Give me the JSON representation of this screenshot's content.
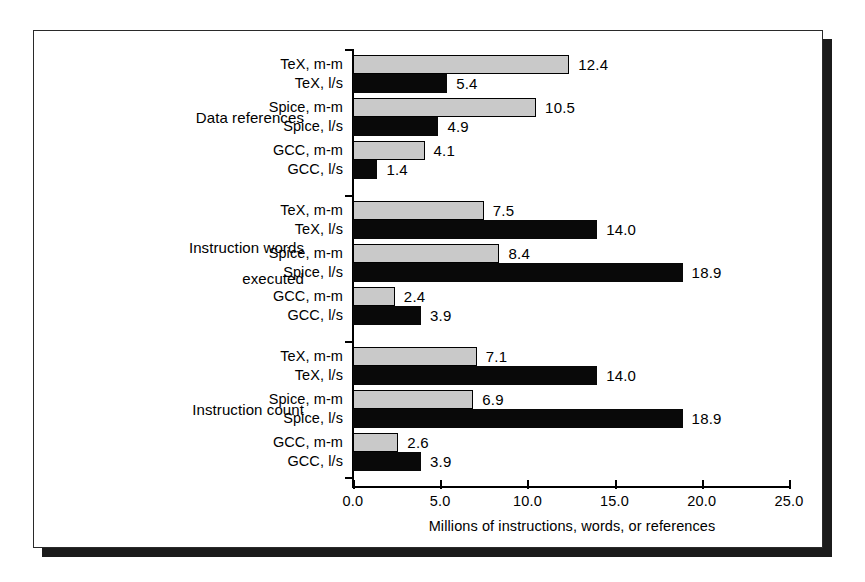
{
  "figure": {
    "x_axis_title": "Millions of instructions, words, or references",
    "x_ticks": [
      "0.0",
      "5.0",
      "10.0",
      "15.0",
      "20.0",
      "25.0"
    ],
    "colors": {
      "gray_fill": "#c9c9c9",
      "black_fill": "#090909",
      "axis": "#000000",
      "frame": "#2a2a2a",
      "shadow": "#1b1b1b",
      "background": "#ffffff"
    }
  },
  "chart_data": {
    "type": "bar",
    "orientation": "horizontal",
    "title": "",
    "subtitle": "",
    "xlabel": "Millions of instructions, words, or references",
    "ylabel": "",
    "xlim": [
      0.0,
      25.0
    ],
    "xticks": [
      0.0,
      5.0,
      10.0,
      15.0,
      20.0,
      25.0
    ],
    "grid": false,
    "legend": "none",
    "value_labels": true,
    "series": [
      {
        "name": "m-m",
        "style": "gray-filled-black-outline"
      },
      {
        "name": "l/s",
        "style": "solid-black"
      }
    ],
    "groups": [
      {
        "label": "Data references",
        "label_lines": [
          "Data references"
        ],
        "bars": [
          {
            "category": "TeX, m-m",
            "series": "m-m",
            "value": 12.4,
            "label": "12.4"
          },
          {
            "category": "TeX, l/s",
            "series": "l/s",
            "value": 5.4,
            "label": "5.4"
          },
          {
            "category": "Spice, m-m",
            "series": "m-m",
            "value": 10.5,
            "label": "10.5"
          },
          {
            "category": "Spice, l/s",
            "series": "l/s",
            "value": 4.9,
            "label": "4.9"
          },
          {
            "category": "GCC, m-m",
            "series": "m-m",
            "value": 4.1,
            "label": "4.1"
          },
          {
            "category": "GCC, l/s",
            "series": "l/s",
            "value": 1.4,
            "label": "1.4"
          }
        ]
      },
      {
        "label": "Instruction words executed",
        "label_lines": [
          "Instruction words",
          "executed"
        ],
        "bars": [
          {
            "category": "TeX, m-m",
            "series": "m-m",
            "value": 7.5,
            "label": "7.5"
          },
          {
            "category": "TeX, l/s",
            "series": "l/s",
            "value": 14.0,
            "label": "14.0"
          },
          {
            "category": "Spice, m-m",
            "series": "m-m",
            "value": 8.4,
            "label": "8.4"
          },
          {
            "category": "Spice, l/s",
            "series": "l/s",
            "value": 18.9,
            "label": "18.9"
          },
          {
            "category": "GCC, m-m",
            "series": "m-m",
            "value": 2.4,
            "label": "2.4"
          },
          {
            "category": "GCC, l/s",
            "series": "l/s",
            "value": 3.9,
            "label": "3.9"
          }
        ]
      },
      {
        "label": "Instruction count",
        "label_lines": [
          "Instruction count"
        ],
        "bars": [
          {
            "category": "TeX, m-m",
            "series": "m-m",
            "value": 7.1,
            "label": "7.1"
          },
          {
            "category": "TeX, l/s",
            "series": "l/s",
            "value": 14.0,
            "label": "14.0"
          },
          {
            "category": "Spice, m-m",
            "series": "m-m",
            "value": 6.9,
            "label": "6.9"
          },
          {
            "category": "Spice, l/s",
            "series": "l/s",
            "value": 18.9,
            "label": "18.9"
          },
          {
            "category": "GCC, m-m",
            "series": "m-m",
            "value": 2.6,
            "label": "2.6"
          },
          {
            "category": "GCC, l/s",
            "series": "l/s",
            "value": 3.9,
            "label": "3.9"
          }
        ]
      }
    ]
  }
}
